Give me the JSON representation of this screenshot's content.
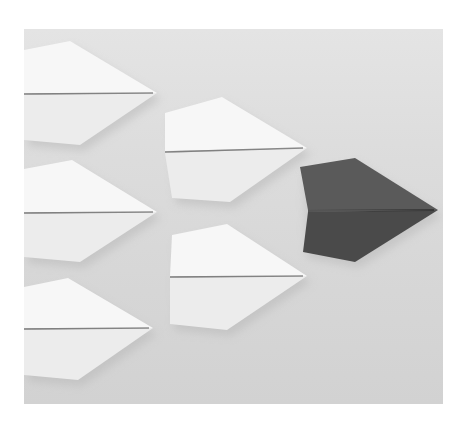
{
  "image": {
    "subject": "paper airplanes",
    "description": "Six white paper airplanes in formation with one dark gray paper airplane leading on the right",
    "colors": {
      "background": "#dadada",
      "white_plane": "#f7f7f7",
      "white_plane_shade": "#ececec",
      "dark_plane": "#5a5a5a",
      "dark_plane_shade": "#4a4a4a",
      "crease": "#6a6a6a"
    },
    "planes": [
      {
        "id": "white-1",
        "color": "white",
        "points": [
          [
            0,
            21
          ],
          [
            46,
            12
          ],
          [
            133,
            64
          ],
          [
            56,
            116
          ],
          [
            0,
            111
          ]
        ],
        "nose": [
          133,
          64
        ],
        "tail_y": 64
      },
      {
        "id": "white-2",
        "color": "white",
        "points": [
          [
            0,
            140
          ],
          [
            48,
            131
          ],
          [
            133,
            183
          ],
          [
            56,
            233
          ],
          [
            0,
            228
          ]
        ],
        "nose": [
          133,
          183
        ],
        "tail_y": 183
      },
      {
        "id": "white-3",
        "color": "white",
        "points": [
          [
            0,
            258
          ],
          [
            44,
            249
          ],
          [
            129,
            299
          ],
          [
            54,
            351
          ],
          [
            0,
            346
          ]
        ],
        "nose": [
          129,
          299
        ],
        "tail_y": 299
      },
      {
        "id": "white-4",
        "color": "white",
        "points": [
          [
            141,
            84
          ],
          [
            198,
            68
          ],
          [
            283,
            119
          ],
          [
            206,
            173
          ],
          [
            148,
            169
          ]
        ],
        "nose": [
          283,
          119
        ],
        "tail_y": 122
      },
      {
        "id": "white-5",
        "color": "white",
        "points": [
          [
            148,
            206
          ],
          [
            203,
            195
          ],
          [
            283,
            247
          ],
          [
            203,
            301
          ],
          [
            146,
            295
          ]
        ],
        "nose": [
          283,
          247
        ],
        "tail_y": 247
      },
      {
        "id": "dark-1",
        "color": "dark",
        "points": [
          [
            276,
            138
          ],
          [
            331,
            129
          ],
          [
            414,
            181
          ],
          [
            331,
            233
          ],
          [
            279,
            223
          ]
        ],
        "nose": [
          414,
          181
        ],
        "tail_y": 181
      }
    ]
  }
}
